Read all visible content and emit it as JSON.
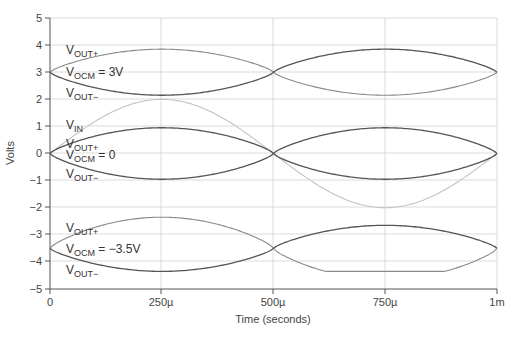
{
  "chart_data": {
    "type": "line",
    "title": "",
    "xlabel": "Time (seconds)",
    "ylabel": "Volts",
    "xlim": [
      0,
      0.001
    ],
    "ylim": [
      -5,
      5
    ],
    "grid": true,
    "legend": "inline annotations",
    "x_ticks": [
      "0",
      "250µ",
      "500µ",
      "750µ",
      "1m"
    ],
    "y_ticks": [
      "5",
      "4",
      "3",
      "2",
      "1",
      "0",
      "−1",
      "−2",
      "−3",
      "−4",
      "−5"
    ],
    "x": [
      0,
      0.00025,
      0.0005,
      0.00075,
      0.001
    ],
    "series": [
      {
        "name": "VIN",
        "group": "VOCM = 0",
        "values": [
          0,
          2,
          0,
          -2,
          0
        ],
        "shape": "sine"
      },
      {
        "name": "VOUT+ (VOCM = 3V)",
        "values": [
          3,
          3.85,
          3,
          2.15,
          3
        ]
      },
      {
        "name": "VOUT- (VOCM = 3V)",
        "values": [
          3,
          2.15,
          3,
          3.85,
          3
        ]
      },
      {
        "name": "VOUT+ (VOCM = 0)",
        "values": [
          0,
          0.95,
          0,
          -0.95,
          0
        ]
      },
      {
        "name": "VOUT- (VOCM = 0)",
        "values": [
          0,
          -0.95,
          0,
          0.95,
          0
        ]
      },
      {
        "name": "VOUT+ (VOCM = -3.5V)",
        "values": [
          -3.5,
          -2.35,
          -3.5,
          -4.35,
          -3.5
        ]
      },
      {
        "name": "VOUT- (VOCM = -3.5V)",
        "values": [
          -3.5,
          -4.35,
          -3.5,
          -2.35,
          -3.5
        ]
      }
    ],
    "annotations": [
      {
        "text": "VOUT+",
        "near": "upper group"
      },
      {
        "text": "VOCM = 3V",
        "near": "upper group"
      },
      {
        "text": "VOUT−",
        "near": "upper group"
      },
      {
        "text": "VIN",
        "near": "middle group"
      },
      {
        "text": "VOUT+",
        "near": "middle group"
      },
      {
        "text": "VOCM = 0",
        "near": "middle group"
      },
      {
        "text": "VOUT−",
        "near": "middle group"
      },
      {
        "text": "VOUT+",
        "near": "lower group"
      },
      {
        "text": "VOCM = −3.5V",
        "near": "lower group"
      },
      {
        "text": "VOUT−",
        "near": "lower group"
      }
    ]
  },
  "labels": {
    "xlabel": "Time (seconds)",
    "ylabel": "Volts",
    "x_ticks": [
      "0",
      "250µ",
      "500µ",
      "750µ",
      "1m"
    ],
    "y_ticks": [
      "5",
      "4",
      "3",
      "2",
      "1",
      "0",
      "−1",
      "−2",
      "−3",
      "−4",
      "−5"
    ],
    "ann": {
      "v": "V",
      "out_plus": "OUT+",
      "out_minus": "OUT−",
      "in": "IN",
      "ocm": "OCM",
      "eq_3v": " = 3V",
      "eq_0": " = 0",
      "eq_m35": " = −3.5V"
    }
  },
  "colors": {
    "grid": "#cfcfcf",
    "axis": "#555555",
    "curve_dark": "#555555",
    "curve_mid": "#8a8a8a",
    "curve_light": "#c2c2c2"
  }
}
